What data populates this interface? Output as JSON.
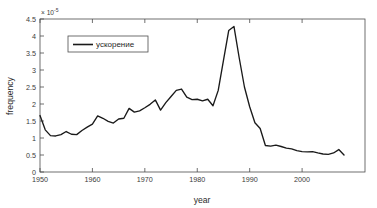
{
  "chart_data": {
    "type": "line",
    "title": "",
    "xlabel": "year",
    "ylabel": "frequency",
    "y_exponent_label": "× 10",
    "y_exponent_power": "-5",
    "xlim": [
      1950,
      2012
    ],
    "ylim": [
      0,
      4.5
    ],
    "xticks": [
      1950,
      1960,
      1970,
      1980,
      1990,
      2000
    ],
    "yticks": [
      0,
      0.5,
      1,
      1.5,
      2,
      2.5,
      3,
      3.5,
      4,
      4.5
    ],
    "grid": false,
    "legend": {
      "position": "upper-left-inside",
      "entries": [
        "ускорение"
      ]
    },
    "series": [
      {
        "name": "ускорение",
        "color": "#1a1a1a",
        "units": "1e-5",
        "x": [
          1950,
          1951,
          1952,
          1953,
          1954,
          1955,
          1956,
          1957,
          1958,
          1959,
          1960,
          1961,
          1962,
          1963,
          1964,
          1965,
          1966,
          1967,
          1968,
          1969,
          1970,
          1971,
          1972,
          1973,
          1974,
          1975,
          1976,
          1977,
          1978,
          1979,
          1980,
          1981,
          1982,
          1983,
          1984,
          1985,
          1986,
          1987,
          1988,
          1989,
          1990,
          1991,
          1992,
          1993,
          1994,
          1995,
          1996,
          1997,
          1998,
          1999,
          2000,
          2001,
          2002,
          2003,
          2004,
          2005,
          2006,
          2007,
          2008
        ],
        "y": [
          1.66,
          1.24,
          1.07,
          1.06,
          1.1,
          1.19,
          1.11,
          1.1,
          1.22,
          1.32,
          1.41,
          1.65,
          1.58,
          1.49,
          1.44,
          1.56,
          1.58,
          1.87,
          1.76,
          1.8,
          1.89,
          1.99,
          2.12,
          1.82,
          2.04,
          2.22,
          2.4,
          2.44,
          2.2,
          2.13,
          2.14,
          2.09,
          2.14,
          1.95,
          2.4,
          3.28,
          4.16,
          4.28,
          3.36,
          2.5,
          1.92,
          1.45,
          1.28,
          0.78,
          0.76,
          0.79,
          0.75,
          0.7,
          0.68,
          0.63,
          0.6,
          0.59,
          0.6,
          0.56,
          0.53,
          0.52,
          0.56,
          0.66,
          0.5
        ]
      }
    ]
  },
  "figure": {
    "axis_color": "#4d4d4d",
    "background": "#ffffff",
    "line_color": "#1a1a1a"
  }
}
